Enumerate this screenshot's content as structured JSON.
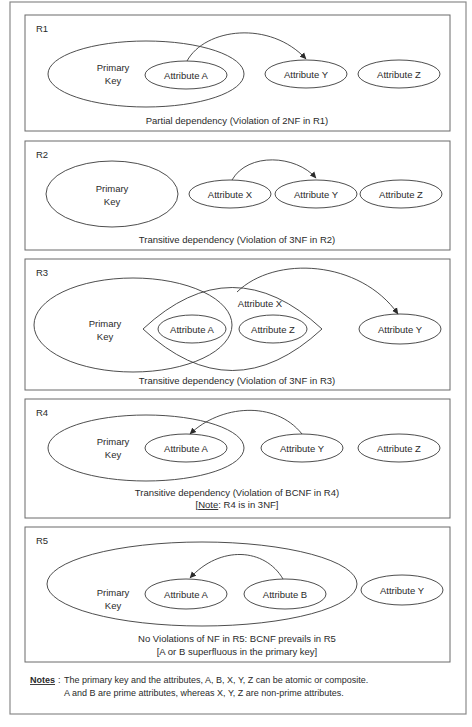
{
  "diagram": {
    "domain_topic": "Normal form violations in relations",
    "panels": [
      {
        "id": "R1",
        "title": "R1",
        "primary_key_label": [
          "Primary",
          "Key"
        ],
        "attributes": [
          "Attribute A",
          "Attribute Y",
          "Attribute Z"
        ],
        "dependency": {
          "from": "Attribute A",
          "to": "Attribute Y"
        },
        "caption": [
          "Partial dependency (Violation of 2NF in R1)"
        ]
      },
      {
        "id": "R2",
        "title": "R2",
        "primary_key_label": [
          "Primary",
          "Key"
        ],
        "attributes": [
          "Attribute X",
          "Attribute Y",
          "Attribute Z"
        ],
        "dependency": {
          "from": "Attribute X",
          "to": "Attribute Y"
        },
        "caption": [
          "Transitive dependency (Violation of 3NF in R2)"
        ]
      },
      {
        "id": "R3",
        "title": "R3",
        "primary_key_label": [
          "Primary",
          "Key"
        ],
        "group_label": "Attribute X",
        "attributes": [
          "Attribute A",
          "Attribute Z",
          "Attribute Y"
        ],
        "dependency": {
          "from": "Attribute X",
          "to": "Attribute Y"
        },
        "caption": [
          "Transitive dependency (Violation of 3NF in R3)"
        ]
      },
      {
        "id": "R4",
        "title": "R4",
        "primary_key_label": [
          "Primary",
          "Key"
        ],
        "attributes": [
          "Attribute A",
          "Attribute Y",
          "Attribute Z"
        ],
        "dependency": {
          "from": "Attribute Y",
          "to": "Attribute A"
        },
        "caption": [
          "Transitive dependency (Violation of BCNF in R4)"
        ],
        "caption_note": {
          "open": "[",
          "label": "Note",
          "text": ": R4 is in 3NF]"
        }
      },
      {
        "id": "R5",
        "title": "R5",
        "primary_key_label": [
          "Primary",
          "Key"
        ],
        "attributes": [
          "Attribute A",
          "Attribute B",
          "Attribute Y"
        ],
        "dependency": {
          "from": "Attribute B",
          "to": "Attribute A"
        },
        "caption": [
          "No Violations of NF in R5: BCNF prevails in R5",
          "[A or B superfluous in the primary key]"
        ]
      }
    ],
    "notes": {
      "heading": "Notes",
      "lines": [
        "The primary key and the attributes, A, B, X, Y, Z  can be atomic or composite.",
        "A and B are prime attributes, whereas X, Y, Z are non-prime attributes."
      ]
    }
  }
}
